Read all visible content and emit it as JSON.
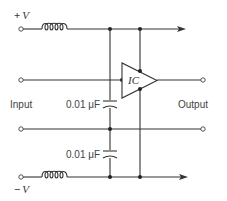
{
  "diagram": {
    "title": "",
    "supply_positive": {
      "sign": "+",
      "symbol": "V"
    },
    "supply_negative": {
      "sign": "−",
      "symbol": "V"
    },
    "input_label": "Input",
    "output_label": "Output",
    "ic_label": "IC",
    "capacitors": [
      {
        "label": "0.01 μF",
        "position": "upper"
      },
      {
        "label": "0.01 μF",
        "position": "lower"
      }
    ],
    "inductors": [
      {
        "name": "positive-supply-choke"
      },
      {
        "name": "negative-supply-choke"
      }
    ]
  }
}
